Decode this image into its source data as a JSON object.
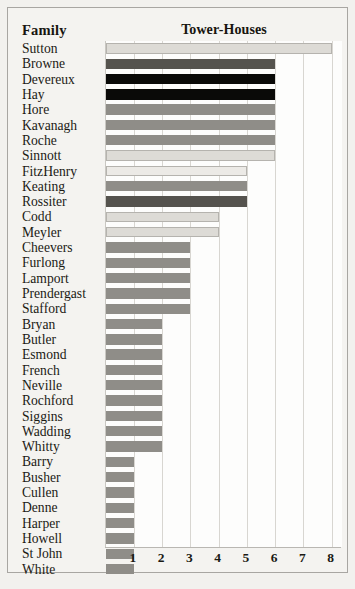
{
  "header": {
    "family_label": "Family",
    "title": "Tower-Houses"
  },
  "axis": {
    "tick_labels": [
      "1",
      "2",
      "3",
      "4",
      "5",
      "6",
      "7",
      "8"
    ]
  },
  "colors": {
    "bar_very_light": "#eceae6",
    "bar_light": "#dddbd6",
    "bar_medium": "#8f8d88",
    "bar_dark": "#55534e",
    "bar_black": "#0a0a08",
    "gridline": "#d8d6d1",
    "axis": "#b9b7b2",
    "plot_background": "#fdfdfc",
    "page_background": "#f2f1ee",
    "text": "#1b1a14"
  },
  "chart_data": {
    "type": "bar",
    "orientation": "horizontal",
    "title": "Tower-Houses",
    "xlabel": "",
    "ylabel": "Family",
    "xlim": [
      0,
      8.35
    ],
    "grid": true,
    "legend": false,
    "xticks": [
      1,
      2,
      3,
      4,
      5,
      6,
      7,
      8
    ],
    "categories": [
      "Sutton",
      "Browne",
      "Devereux",
      "Hay",
      "Hore",
      "Kavanagh",
      "Roche",
      "Sinnott",
      "FitzHenry",
      "Keating",
      "Rossiter",
      "Codd",
      "Meyler",
      "Cheevers",
      "Furlong",
      "Lamport",
      "Prendergast",
      "Stafford",
      "Bryan",
      "Butler",
      "Esmond",
      "French",
      "Neville",
      "Rochford",
      "Siggins",
      "Wadding",
      "Whitty",
      "Barry",
      "Busher",
      "Cullen",
      "Denne",
      "Harper",
      "Howell",
      "St John",
      "White"
    ],
    "values": [
      8,
      6,
      6,
      6,
      6,
      6,
      6,
      6,
      5,
      5,
      5,
      4,
      4,
      3,
      3,
      3,
      3,
      3,
      2,
      2,
      2,
      2,
      2,
      2,
      2,
      2,
      2,
      1,
      1,
      1,
      1,
      1,
      1,
      1,
      1
    ],
    "bar_colors": [
      "#dddbd6",
      "#55534e",
      "#0a0a08",
      "#0a0a08",
      "#8f8d88",
      "#8f8d88",
      "#8f8d88",
      "#dddbd6",
      "#eceae6",
      "#8f8d88",
      "#55534e",
      "#dddbd6",
      "#dddbd6",
      "#8f8d88",
      "#8f8d88",
      "#8f8d88",
      "#8f8d88",
      "#8f8d88",
      "#8f8d88",
      "#8f8d88",
      "#8f8d88",
      "#8f8d88",
      "#8f8d88",
      "#8f8d88",
      "#8f8d88",
      "#8f8d88",
      "#8f8d88",
      "#8f8d88",
      "#8f8d88",
      "#8f8d88",
      "#8f8d88",
      "#8f8d88",
      "#8f8d88",
      "#8f8d88",
      "#8f8d88"
    ]
  }
}
